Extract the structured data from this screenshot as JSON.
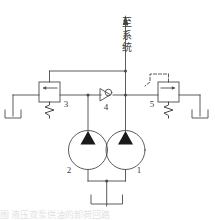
{
  "figure": {
    "type": "hydraulic-circuit-schematic",
    "background_color": "#ffffff",
    "line_color": "#4a4a4a",
    "text_color": "#3c3c3c",
    "width": 215,
    "height": 220
  },
  "annotations": {
    "to_system": "至系统",
    "to_system_chars": [
      "至",
      "系",
      "统"
    ]
  },
  "components": [
    {
      "id": "1",
      "label": "1",
      "name": "pump-high-pressure",
      "symbol": "pump-circle-with-filled-triangle"
    },
    {
      "id": "2",
      "label": "2",
      "name": "pump-low-pressure",
      "symbol": "pump-circle-with-filled-triangle"
    },
    {
      "id": "3",
      "label": "3",
      "name": "relief-valve-left",
      "symbol": "spring-loaded-relief-valve"
    },
    {
      "id": "4",
      "label": "4",
      "name": "check-valve",
      "symbol": "ball-check-valve"
    },
    {
      "id": "5",
      "label": "5",
      "name": "pilot-operated-unloading-valve",
      "symbol": "spring-loaded-valve-with-pilot-line"
    }
  ],
  "caption": {
    "text": "图                           液压双泵供油的卸荷回路"
  }
}
